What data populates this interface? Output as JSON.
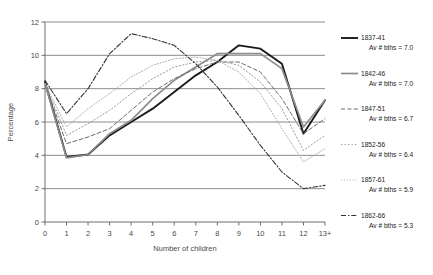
{
  "chart_data": {
    "type": "line",
    "title": "",
    "xlabel": "Number of children",
    "ylabel": "Percentage",
    "x": [
      "0",
      "1",
      "2",
      "3",
      "4",
      "5",
      "6",
      "7",
      "8",
      "9",
      "10",
      "11",
      "12",
      "13+"
    ],
    "xlim": [
      0,
      13
    ],
    "ylim": [
      0,
      12
    ],
    "yticks": [
      0,
      2,
      4,
      6,
      8,
      10,
      12
    ],
    "grid": true,
    "legend_position": "right",
    "series": [
      {
        "name": "1837-41",
        "note": "Av # bths = 7.0",
        "style": "solid",
        "color": "#1a1a1a",
        "width": 1.9,
        "values": [
          8.4,
          3.9,
          4.05,
          5.2,
          6.0,
          6.8,
          7.8,
          8.8,
          9.6,
          10.6,
          10.4,
          9.5,
          5.3,
          7.3
        ]
      },
      {
        "name": "1842-46",
        "note": "Av # bths = 7.0",
        "style": "solid",
        "color": "#8c8c8c",
        "width": 1.7,
        "values": [
          8.3,
          3.85,
          4.05,
          5.3,
          6.1,
          7.4,
          8.5,
          9.3,
          10.1,
          10.1,
          10.1,
          9.2,
          5.7,
          7.3
        ]
      },
      {
        "name": "1847-51",
        "note": "Av # bths = 6.7",
        "style": "dashed",
        "color": "#6b6b6b",
        "width": 1.0,
        "values": [
          8.3,
          4.7,
          5.1,
          5.6,
          6.7,
          7.8,
          8.6,
          9.2,
          9.6,
          9.6,
          9.0,
          7.4,
          5.3,
          6.2
        ]
      },
      {
        "name": "1852-56",
        "note": "Av # bths = 6.4",
        "style": "dotted-sparse",
        "color": "#9a9a9a",
        "width": 1.0,
        "values": [
          8.3,
          5.2,
          5.9,
          6.7,
          7.7,
          8.6,
          9.3,
          9.6,
          9.7,
          9.4,
          8.4,
          6.8,
          4.3,
          5.2
        ]
      },
      {
        "name": "1857-61",
        "note": "Av # bths = 5.9",
        "style": "dotted",
        "color": "#aaaaaa",
        "width": 1.0,
        "values": [
          8.3,
          5.7,
          6.8,
          7.7,
          8.7,
          9.4,
          9.8,
          9.9,
          9.7,
          9.0,
          7.7,
          5.6,
          3.6,
          4.4
        ]
      },
      {
        "name": "1862-66",
        "note": "Av # bths = 5.3",
        "style": "dash-dot",
        "color": "#333333",
        "width": 1.1,
        "values": [
          8.5,
          6.5,
          8.0,
          10.1,
          11.3,
          11.0,
          10.6,
          9.5,
          8.1,
          6.4,
          4.6,
          3.0,
          2.0,
          2.2
        ]
      }
    ]
  }
}
